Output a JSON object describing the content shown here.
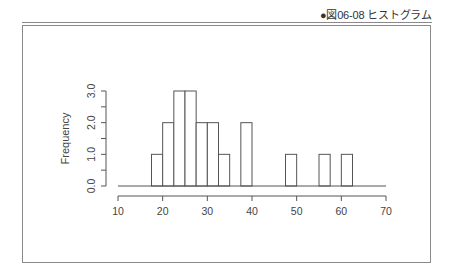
{
  "caption": "●図06-08 ヒストグラム",
  "chart_data": {
    "type": "bar",
    "subtype": "histogram",
    "title": "",
    "xlabel": "",
    "ylabel": "Frequency",
    "xlim": [
      10,
      70
    ],
    "ylim": [
      0,
      3
    ],
    "x_ticks": [
      "10",
      "20",
      "30",
      "40",
      "50",
      "60",
      "70"
    ],
    "y_ticks": [
      "0.0",
      "1.0",
      "2.0",
      "3.0"
    ],
    "bin_width": 2.5,
    "bins": [
      {
        "start": 17.5,
        "end": 20.0,
        "count": 1
      },
      {
        "start": 20.0,
        "end": 22.5,
        "count": 2
      },
      {
        "start": 22.5,
        "end": 25.0,
        "count": 3
      },
      {
        "start": 25.0,
        "end": 27.5,
        "count": 3
      },
      {
        "start": 27.5,
        "end": 30.0,
        "count": 2
      },
      {
        "start": 30.0,
        "end": 32.5,
        "count": 2
      },
      {
        "start": 32.5,
        "end": 35.0,
        "count": 1
      },
      {
        "start": 35.0,
        "end": 37.5,
        "count": 0
      },
      {
        "start": 37.5,
        "end": 40.0,
        "count": 2
      },
      {
        "start": 47.5,
        "end": 50.0,
        "count": 1
      },
      {
        "start": 55.0,
        "end": 57.5,
        "count": 1
      },
      {
        "start": 60.0,
        "end": 62.5,
        "count": 1
      }
    ],
    "grid": false,
    "legend": null
  }
}
